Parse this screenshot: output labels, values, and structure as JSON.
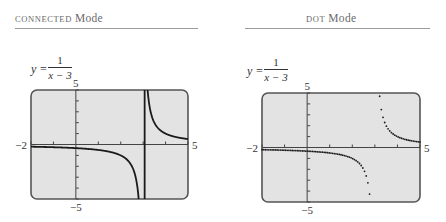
{
  "panels": [
    {
      "title_small": "CONNECTED",
      "title_big": "Mode",
      "equation": {
        "lhs": "y =",
        "numerator": "1",
        "denominator": "x − 3"
      },
      "mode": "connected"
    },
    {
      "title_small": "DOT",
      "title_big": "Mode",
      "equation": {
        "lhs": "y =",
        "numerator": "1",
        "denominator": "x − 3"
      },
      "mode": "dot"
    }
  ],
  "colors": {
    "screen_bg": "#e3e3e3",
    "screen_border": "#555555",
    "curve": "#1a1a1a",
    "axis": "#444444"
  },
  "chart_data": [
    {
      "type": "line",
      "title": "Connected Mode",
      "function": "y = 1/(x - 3)",
      "xlim": [
        -2,
        5
      ],
      "ylim": [
        -5,
        5
      ],
      "x_tick_step": 1,
      "y_tick_step": 1,
      "tick_labels": {
        "xmin": "−2",
        "xmax": "5",
        "ymin": "−5",
        "ymax": "5"
      },
      "asymptote_x": 3,
      "connected_spurious_vertical_line": true,
      "grid": false
    },
    {
      "type": "scatter",
      "title": "Dot Mode",
      "function": "y = 1/(x - 3)",
      "xlim": [
        -2,
        5
      ],
      "ylim": [
        -5,
        5
      ],
      "x_tick_step": 1,
      "y_tick_step": 1,
      "tick_labels": {
        "xmin": "−2",
        "xmax": "5",
        "ymin": "−5",
        "ymax": "5"
      },
      "asymptote_x": 3,
      "grid": false
    }
  ]
}
